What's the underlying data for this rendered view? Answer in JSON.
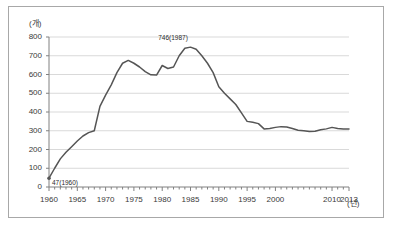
{
  "chart_data": {
    "type": "line",
    "title": "",
    "xlabel": "(년)",
    "ylabel": "(개)",
    "xlim": [
      1960,
      2013
    ],
    "ylim": [
      0,
      800
    ],
    "grid": "horizontal",
    "legend": "none",
    "y_ticks": [
      0,
      100,
      200,
      300,
      400,
      500,
      600,
      700,
      800
    ],
    "x_ticks": [
      1960,
      1965,
      1970,
      1975,
      1980,
      1985,
      1990,
      1995,
      2000,
      2010,
      2013
    ],
    "x_tick_labels": [
      "1960",
      "1965",
      "1970",
      "1975",
      "1980",
      "1985",
      "1990",
      "1995",
      "2000",
      "2010",
      "2013"
    ],
    "x_minor_tick_interval": 1,
    "line_color": "#555555",
    "grid_color": "#d9d9d9",
    "axis_color": "#808080",
    "annotations": [
      {
        "text": "47(1960)",
        "x": 1960,
        "y": 47
      },
      {
        "text": "746(1987)",
        "x": 1983,
        "y": 746
      }
    ],
    "x": [
      1960,
      1961,
      1962,
      1963,
      1964,
      1965,
      1966,
      1967,
      1968,
      1969,
      1970,
      1971,
      1972,
      1973,
      1974,
      1975,
      1976,
      1977,
      1978,
      1979,
      1980,
      1981,
      1982,
      1983,
      1984,
      1985,
      1986,
      1987,
      1988,
      1989,
      1990,
      1991,
      1992,
      1993,
      1994,
      1995,
      1996,
      1997,
      1998,
      1999,
      2000,
      2001,
      2002,
      2003,
      2004,
      2005,
      2006,
      2007,
      2008,
      2009,
      2010,
      2011,
      2012,
      2013
    ],
    "values": [
      47,
      100,
      150,
      185,
      215,
      245,
      272,
      290,
      300,
      430,
      490,
      545,
      610,
      660,
      675,
      660,
      640,
      615,
      598,
      597,
      648,
      632,
      640,
      700,
      740,
      746,
      735,
      700,
      660,
      610,
      535,
      500,
      470,
      440,
      395,
      350,
      345,
      338,
      310,
      312,
      318,
      322,
      320,
      312,
      303,
      300,
      296,
      297,
      305,
      310,
      318,
      312,
      310,
      309
    ]
  },
  "axis_units": {
    "y_unit": "(개)",
    "x_unit": "(년)"
  }
}
